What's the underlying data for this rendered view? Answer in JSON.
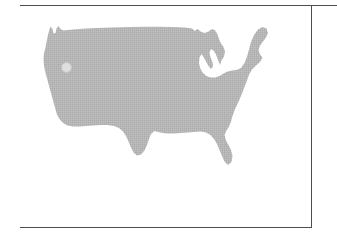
{
  "figure": {
    "type": "map",
    "region": "Contiguous United States",
    "map_fill_color": "#b5b5b5",
    "map_texture": "halftone-dither",
    "background_color": "#ffffff",
    "rule_color": "#4d4d4d",
    "caption": ""
  },
  "markers": [
    {
      "id": "marker-1",
      "label": "",
      "location_hint": "Pacific Northwest",
      "x_px": 46,
      "y_px": 61,
      "radius_px": 5,
      "fill_color": "#dedede",
      "stroke_color": "#c6c6c6"
    }
  ],
  "frame": {
    "top_rule": "",
    "bottom_rule": "",
    "vertical_divider": ""
  },
  "side_panel": {
    "content": ""
  }
}
